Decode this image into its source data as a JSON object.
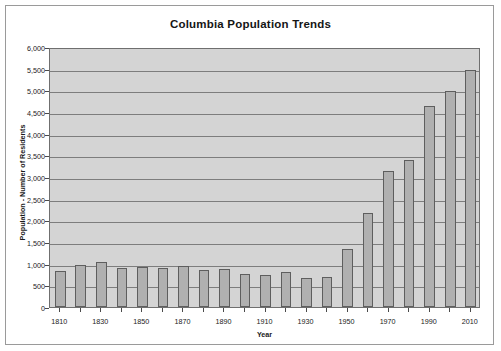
{
  "chart_data": {
    "type": "bar",
    "title": "Columbia Population Trends",
    "xlabel": "Year",
    "ylabel": "Population - Number of Residents",
    "ylim": [
      0,
      6000
    ],
    "ytick_step": 500,
    "grid": true,
    "legend": "none",
    "series_name": "Population",
    "categories": [
      "1810",
      "1820",
      "1830",
      "1840",
      "1850",
      "1860",
      "1870",
      "1880",
      "1890",
      "1900",
      "1910",
      "1920",
      "1930",
      "1940",
      "1950",
      "1960",
      "1970",
      "1980",
      "1990",
      "2000",
      "2010"
    ],
    "values": [
      840,
      970,
      1030,
      900,
      930,
      910,
      950,
      850,
      880,
      760,
      740,
      800,
      670,
      690,
      1350,
      2180,
      3130,
      3390,
      4650,
      4990,
      5480
    ],
    "ytick_labels": [
      "0",
      "500",
      "1,000",
      "1,500",
      "2,000",
      "2,500",
      "3,000",
      "3,500",
      "4,000",
      "4,500",
      "5,000",
      "5,500",
      "6,000"
    ],
    "xtick_labels": [
      "1810",
      "1830",
      "1850",
      "1870",
      "1890",
      "1910",
      "1930",
      "1950",
      "1970",
      "1990",
      "2010"
    ],
    "colors": {
      "bar_fill": "#b0b0b0",
      "bar_border": "#5e5e5e",
      "plot_background": "#d4d4d4",
      "gridline": "#7d7d7d",
      "frame_border": "#9a9a9a",
      "text": "#1a1a1a"
    }
  }
}
